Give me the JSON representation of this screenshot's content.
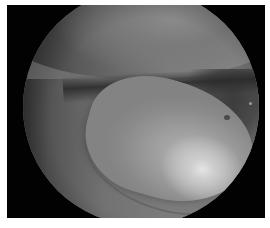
{
  "image": {
    "description": "Grayscale arthroscopic view of a joint showing a bright rounded tissue bulge in a circular scope field on black background",
    "colors": {
      "border": "#ffffff",
      "background": "#020202",
      "tissue_mid": "#7c7c7c",
      "highlight": "#e4e4e4",
      "spot": "#4a4a4a"
    }
  }
}
